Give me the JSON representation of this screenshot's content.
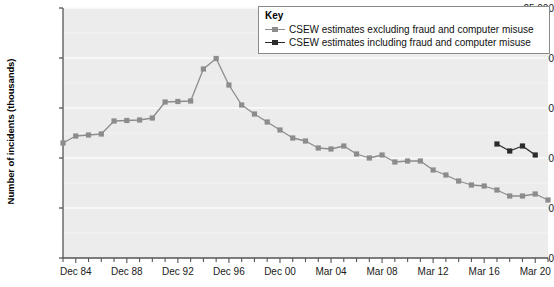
{
  "chart_data": {
    "type": "line",
    "title": "",
    "xlabel": "",
    "ylabel": "Number of incidents (thousands)",
    "ylim": [
      0,
      25000
    ],
    "ytick_labels": [
      "0",
      "5,000",
      "10,000",
      "15,000",
      "20,000",
      "25,000"
    ],
    "ytick_values": [
      0,
      5000,
      10000,
      15000,
      20000,
      25000
    ],
    "xtick_labels": [
      "Dec 84",
      "Dec 88",
      "Dec 92",
      "Dec 96",
      "Dec 00",
      "Mar 04",
      "Mar 08",
      "Mar 12",
      "Mar 16",
      "Mar 20"
    ],
    "xtick_index": [
      1,
      5,
      9,
      13,
      17,
      21,
      25,
      29,
      33,
      37
    ],
    "x_index_range": [
      0,
      38
    ],
    "grid": "horizontal",
    "legend_position": "top-right",
    "series": [
      {
        "name": "CSEW estimates excluding fraud and computer misuse",
        "color": "#8c8c8c",
        "x": [
          0,
          1,
          2,
          3,
          4,
          5,
          6,
          7,
          8,
          9,
          10,
          11,
          12,
          13,
          14,
          15,
          16,
          17,
          18,
          19,
          20,
          21,
          22,
          23,
          24,
          25,
          26,
          27,
          28,
          29,
          30,
          31,
          32,
          33,
          34,
          35,
          36,
          37,
          38
        ],
        "values": [
          11500,
          12200,
          12300,
          12400,
          13700,
          13750,
          13800,
          14000,
          15600,
          15650,
          15700,
          18900,
          19950,
          17300,
          15300,
          14400,
          13600,
          12800,
          12000,
          11700,
          11000,
          10900,
          11200,
          10400,
          10000,
          10300,
          9600,
          9700,
          9700,
          8800,
          8300,
          7700,
          7300,
          7200,
          6800,
          6200,
          6200,
          6400,
          5800
        ]
      },
      {
        "name": "CSEW estimates including fraud and computer misuse",
        "color": "#2b2b2b",
        "x": [
          34,
          35,
          36,
          37
        ],
        "values": [
          11400,
          10700,
          11200,
          10300
        ]
      }
    ]
  },
  "legend": {
    "title": "Key",
    "entries": [
      {
        "label": "CSEW estimates excluding fraud and computer misuse",
        "color": "#8c8c8c"
      },
      {
        "label": "CSEW estimates including fraud and computer misuse",
        "color": "#2b2b2b"
      }
    ]
  },
  "style": {
    "plot_background": "#ececec",
    "gridline_color": "#fbfbfb",
    "axis_color": "#555555"
  }
}
